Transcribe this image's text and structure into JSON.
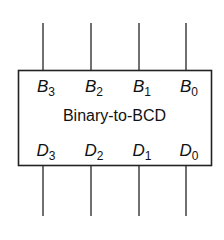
{
  "block": {
    "title": "Binary-to-BCD",
    "inputs": [
      {
        "letter": "B",
        "index": "3"
      },
      {
        "letter": "B",
        "index": "2"
      },
      {
        "letter": "B",
        "index": "1"
      },
      {
        "letter": "B",
        "index": "0"
      }
    ],
    "outputs": [
      {
        "letter": "D",
        "index": "3"
      },
      {
        "letter": "D",
        "index": "2"
      },
      {
        "letter": "D",
        "index": "1"
      },
      {
        "letter": "D",
        "index": "0"
      }
    ]
  }
}
